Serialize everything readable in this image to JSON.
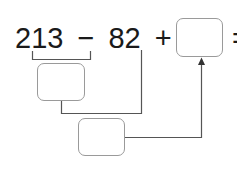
{
  "equation": {
    "terms": [
      "213",
      "−",
      "82",
      "+",
      "18",
      "="
    ],
    "full_text": "213 − 82 + 18 ="
  },
  "boxes": {
    "answer": "",
    "step1": "",
    "step2": ""
  },
  "colors": {
    "text": "#1a1a1a",
    "line": "#555555",
    "box_border": "#9a9a9a"
  }
}
